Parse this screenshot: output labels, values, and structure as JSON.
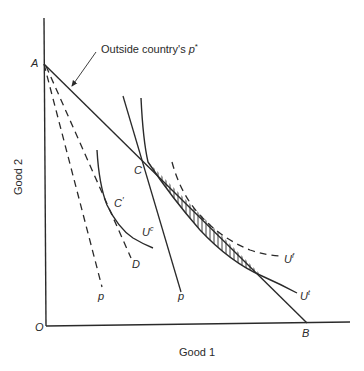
{
  "diagram": {
    "axes": {
      "x_label": "Good 1",
      "y_label": "Good 2",
      "origin_label": "O"
    },
    "points": {
      "A": "A",
      "B": "B",
      "C": "C",
      "C_prime": "C",
      "C_prime_mark": "′",
      "D": "D"
    },
    "annotation": {
      "text_main": "Outside country's ",
      "text_var": "p",
      "text_sup": "*"
    },
    "price_labels": {
      "p_left": "p",
      "p_right": "p"
    },
    "curves": {
      "U_c": {
        "base": "U",
        "sup": "c"
      },
      "U_f": {
        "base": "U",
        "sup": "f"
      },
      "U_t": {
        "base": "U",
        "sup": "t"
      }
    },
    "colors": {
      "ink": "#2a2a2a",
      "background": "#ffffff"
    }
  }
}
